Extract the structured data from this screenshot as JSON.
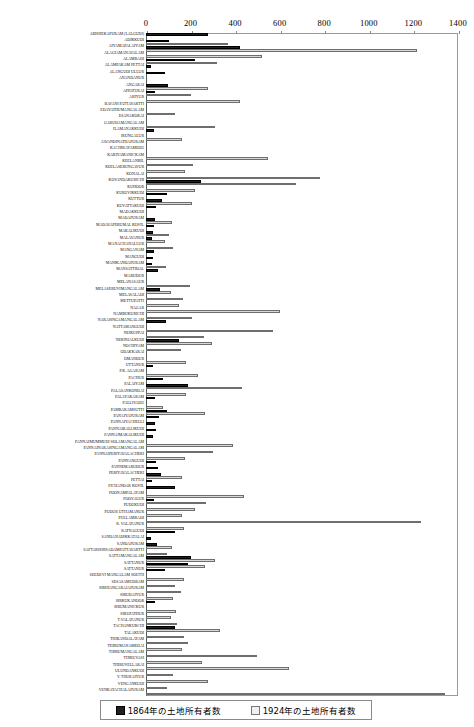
{
  "chart_data": {
    "type": "bar",
    "orientation": "horizontal",
    "title": "",
    "xlabel": "",
    "ylabel": "",
    "xlim": [
      0,
      1400
    ],
    "xticks": [
      0,
      200,
      400,
      600,
      800,
      1000,
      1200,
      1400
    ],
    "grid": false,
    "legend_position": "bottom",
    "series": [
      {
        "name": "1864年の土地所有者数",
        "color": "#202020"
      },
      {
        "name": "1924年の土地所有者数",
        "color": "#f0f0f0"
      }
    ],
    "categories": [
      "ABISHEKAPURAM (LALGUDI)",
      "ADIKKUDI",
      "AIYAMAPALAIYAM",
      "ALAGIAMANAVALAM",
      "ALAMBADI",
      "ALAMPAKAM PETTAI",
      "ALANGUDI ULLUR",
      "ANANDANUR",
      "ANGARAI",
      "APPATURAI",
      "ARIYUR",
      "BAVANI PATTAVARTTI",
      "EDAYATHUMANGALAM",
      "ESANAKORAI",
      "GARUDAMANGALAM",
      "ILAMANAKKUDI",
      "IRUNGALUR",
      "JAVANDINATHAPURAM",
      "KACHIRAYAMEDU",
      "KARIYAMANICKAM",
      "KEELANBIL",
      "KEELASERUNGAVUR",
      "KONALAI",
      "KOVANDAKURICHI",
      "KUHOOR",
      "KURUVIKKUDI",
      "KUTTUR",
      "KUVATTAKUDI",
      "MADAKKUDI",
      "MADAPURAM",
      "MADAVAPERUMAL KOVIL",
      "MAKALIKUDI",
      "MALAVANUR",
      "MANACHANALLUR",
      "MANGANAM",
      "MANGUDI",
      "MANIKANDAPURAM",
      "MANSATTIDAL",
      "MARUDUR",
      "MELANASAUR",
      "MELASERUVIMANGALAM",
      "MELAVALADI",
      "METTUPATTI",
      "NAGAR",
      "NAMBUKURICHI",
      "NARASINGAMANGALAM",
      "NATTAMANGUDI",
      "NEIKUPPAI",
      "NERINJALKUDI",
      "NOCHIYAM",
      "ODAKKARAI",
      "OMANDUR",
      "UTTANUR",
      "P.K. AGARAM",
      "PACHUR",
      "PALAIYAM",
      "PALASANKONDAI",
      "PALAYAKARAM",
      "PALLIVADU",
      "PAMBARAMSUTTI",
      "PANAIYAPURAM",
      "PANNAYACHELLI",
      "PANNAIBALLIKUDI",
      "PANNAIMAKALIKUDI",
      "PANNAIMUMMUDI SOLAMANGALAM",
      "PANNAINARASINGAMANGALAM",
      "PANNAIPERIYAVALACHERI",
      "PANNANGUDI",
      "PANNEMARUDUR",
      "PERIYAVALACHERI",
      "PETTAI",
      "PICHANDAR KOVIL",
      "POONAMPALAYAM",
      "POOVALUR",
      "PUDUKUDI",
      "PUDUR UTHAMANUR",
      "PULLAMBADI",
      "R. VALAYANUR",
      "RATNAGUDI",
      "SANDANADIKKATALAI",
      "SANDAPURAM",
      "SAPTARISHISADAMPATTAVARTTI",
      "SATTAMANGALAM",
      "SATTANUR",
      "SATTANUR",
      "SEEDEVI MANGALAM SOUTH",
      "SESASAMUDRAM",
      "SIRIHANGARAJAPURAM",
      "SIRUDAIYUR",
      "SIRKUKANOOR",
      "SIRUMANICKUR",
      "SIRUPATHUR",
      "T.VALAYANUR",
      "TACHANKURCHI",
      "TALAKUDI",
      "THIRANDALAYAM",
      "THIRUMANAMEDAI",
      "THIRUMANGALAM",
      "THIRUVELLARAI",
      "ULUNDANKUDI",
      "V. THURAIYUR",
      "VENGANKUDI",
      "VENKATACHALAPURAM"
    ],
    "values_1864": [
      278,
      105,
      420,
      0,
      222,
      22,
      85,
      0,
      97,
      40,
      0,
      0,
      0,
      0,
      0,
      0,
      35,
      0,
      0,
      0,
      0,
      0,
      0,
      248,
      0,
      0,
      72,
      0,
      0,
      0,
      0,
      0,
      0,
      0,
      0,
      0,
      0,
      0,
      0,
      0,
      62,
      0,
      0,
      0,
      0,
      88,
      0,
      0,
      148,
      0,
      0,
      0,
      30,
      0,
      78,
      188,
      0,
      0,
      0,
      95,
      60,
      40,
      45,
      30,
      0,
      0,
      0,
      0,
      55,
      0,
      128,
      35,
      0,
      0,
      0,
      0,
      0,
      130,
      22,
      50,
      0,
      200,
      190,
      0,
      0,
      0,
      0,
      0,
      0,
      0,
      0,
      0,
      130,
      0,
      0,
      0,
      0,
      0,
      0,
      0,
      0,
      0
    ],
    "values_1924": [
      0,
      368,
      1218,
      522,
      0,
      0,
      0,
      0,
      278,
      200,
      420,
      0,
      0,
      0,
      310,
      160,
      0,
      300,
      0,
      548,
      0,
      0,
      0,
      780,
      0,
      0,
      0,
      0,
      0,
      330,
      250,
      0,
      125,
      0,
      0,
      0,
      0,
      0,
      0,
      198,
      112,
      168,
      0,
      600,
      205,
      0,
      0,
      602,
      295,
      155,
      0,
      0,
      180,
      235,
      0,
      430,
      180,
      0,
      0,
      265,
      0,
      0,
      0,
      0,
      390,
      300,
      175,
      0,
      0,
      160,
      92,
      0,
      440,
      270,
      220,
      160,
      1232,
      0,
      0,
      0,
      118,
      0,
      0,
      310,
      0,
      265,
      0,
      0,
      0,
      0,
      0,
      0,
      0,
      0,
      0,
      0,
      0,
      0,
      0,
      0,
      0,
      0
    ]
  },
  "rows": [
    {
      "label": "ABISHEKAPURAM (LALGUDI)",
      "v1864": 278,
      "v1924": 0
    },
    {
      "label": "ADIKKUDI",
      "v1864": 105,
      "v1924": 368
    },
    {
      "label": "AIYAMAPALAIYAM",
      "v1864": 420,
      "v1924": 1218
    },
    {
      "label": "ALAGIAMANAVALAM",
      "v1864": 0,
      "v1924": 522
    },
    {
      "label": "ALAMBADI",
      "v1864": 222,
      "v1924": 318
    },
    {
      "label": "ALAMPAKAM PETTAI",
      "v1864": 22,
      "v1924": 0
    },
    {
      "label": "ALANGUDI ULLUR",
      "v1864": 85,
      "v1924": 0
    },
    {
      "label": "ANANDANUR",
      "v1864": 0,
      "v1924": 0
    },
    {
      "label": "ANGARAI",
      "v1864": 97,
      "v1924": 278
    },
    {
      "label": "APPATURAI",
      "v1864": 40,
      "v1924": 200
    },
    {
      "label": "ARIYUR",
      "v1864": 0,
      "v1924": 420
    },
    {
      "label": "BAVANI PATTAVARTTI",
      "v1864": 0,
      "v1924": 0
    },
    {
      "label": "EDAYATHUMANGALAM",
      "v1864": 0,
      "v1924": 132
    },
    {
      "label": "ESANAKORAI",
      "v1864": 0,
      "v1924": 0
    },
    {
      "label": "GARUDAMANGALAM",
      "v1864": 0,
      "v1924": 310
    },
    {
      "label": "ILAMANAKKUDI",
      "v1864": 35,
      "v1924": 0
    },
    {
      "label": "IRUNGALUR",
      "v1864": 0,
      "v1924": 160
    },
    {
      "label": "JAVANDINATHAPURAM",
      "v1864": 0,
      "v1924": 0
    },
    {
      "label": "KACHIRAYAMEDU",
      "v1864": 0,
      "v1924": 0
    },
    {
      "label": "KARIYAMANICKAM",
      "v1864": 0,
      "v1924": 548
    },
    {
      "label": "KEELANBIL",
      "v1864": 0,
      "v1924": 210
    },
    {
      "label": "KEELASERUNGAVUR",
      "v1864": 0,
      "v1924": 175
    },
    {
      "label": "KONALAI",
      "v1864": 0,
      "v1924": 780
    },
    {
      "label": "KOVANDAKURICHI",
      "v1864": 248,
      "v1924": 672
    },
    {
      "label": "KUHOOR",
      "v1864": 0,
      "v1924": 222
    },
    {
      "label": "KURUVIKKUDI",
      "v1864": 95,
      "v1924": 0
    },
    {
      "label": "KUTTUR",
      "v1864": 72,
      "v1924": 205
    },
    {
      "label": "KUVATTAKUDI",
      "v1864": 45,
      "v1924": 0
    },
    {
      "label": "MADAKKUDI",
      "v1864": 0,
      "v1924": 0
    },
    {
      "label": "MADAPURAM",
      "v1864": 40,
      "v1924": 115
    },
    {
      "label": "MADAVAPERUMAL KOVIL",
      "v1864": 35,
      "v1924": 0
    },
    {
      "label": "MAKALIKUDI",
      "v1864": 30,
      "v1924": 105
    },
    {
      "label": "MALAVANUR",
      "v1864": 28,
      "v1924": 85
    },
    {
      "label": "MANACHANALLUR",
      "v1864": 0,
      "v1924": 120
    },
    {
      "label": "MANGANAM",
      "v1864": 38,
      "v1924": 0
    },
    {
      "label": "MANGUDI",
      "v1864": 30,
      "v1924": 0
    },
    {
      "label": "MANIKANDAPURAM",
      "v1864": 25,
      "v1924": 90
    },
    {
      "label": "MANSATTIDAL",
      "v1864": 55,
      "v1924": 0
    },
    {
      "label": "MARUDUR",
      "v1864": 0,
      "v1924": 0
    },
    {
      "label": "MELANASAUR",
      "v1864": 0,
      "v1924": 198
    },
    {
      "label": "MELASERUVIMANGALAM",
      "v1864": 62,
      "v1924": 112
    },
    {
      "label": "MELAVALADI",
      "v1864": 0,
      "v1924": 168
    },
    {
      "label": "METTUPATTI",
      "v1864": 0,
      "v1924": 148
    },
    {
      "label": "NAGAR",
      "v1864": 0,
      "v1924": 600
    },
    {
      "label": "NAMBUKURICHI",
      "v1864": 0,
      "v1924": 205
    },
    {
      "label": "NARASINGAMANGALAM",
      "v1864": 88,
      "v1924": 0
    },
    {
      "label": "NATTAMANGUDI",
      "v1864": 0,
      "v1924": 570
    },
    {
      "label": "NEIKUPPAI",
      "v1864": 0,
      "v1924": 260
    },
    {
      "label": "NERINJALKUDI",
      "v1864": 148,
      "v1924": 295
    },
    {
      "label": "NOCHIYAM",
      "v1864": 0,
      "v1924": 155
    },
    {
      "label": "ODAKKARAI",
      "v1864": 0,
      "v1924": 0
    },
    {
      "label": "OMANDUR",
      "v1864": 0,
      "v1924": 178
    },
    {
      "label": "UTTANUR",
      "v1864": 30,
      "v1924": 0
    },
    {
      "label": "P.K. AGARAM",
      "v1864": 0,
      "v1924": 235
    },
    {
      "label": "PACHUR",
      "v1864": 78,
      "v1924": 0
    },
    {
      "label": "PALAIYAM",
      "v1864": 188,
      "v1924": 430
    },
    {
      "label": "PALASANKONDAI",
      "v1864": 0,
      "v1924": 180
    },
    {
      "label": "PALAYAKARAM",
      "v1864": 40,
      "v1924": 0
    },
    {
      "label": "PALLIVADU",
      "v1864": 0,
      "v1924": 78
    },
    {
      "label": "PAMBARAMSUTTI",
      "v1864": 95,
      "v1924": 265
    },
    {
      "label": "PANAIYAPURAM",
      "v1864": 60,
      "v1924": 0
    },
    {
      "label": "PANNAIYACHELLI",
      "v1864": 40,
      "v1924": 0
    },
    {
      "label": "PANNAIBALLIKUDI",
      "v1864": 45,
      "v1924": 0
    },
    {
      "label": "PANNAIMAKALIKUDI",
      "v1864": 30,
      "v1924": 0
    },
    {
      "label": "PANNAIMUMMUDI SOLAMANGALAM",
      "v1864": 0,
      "v1924": 390
    },
    {
      "label": "PANNAINARASINGAMANGALAM",
      "v1864": 0,
      "v1924": 300
    },
    {
      "label": "PANNAIPERIYAVALACHERI",
      "v1864": 0,
      "v1924": 175
    },
    {
      "label": "PANNANGUDI",
      "v1864": 45,
      "v1924": 0
    },
    {
      "label": "PANNEMARUDUR",
      "v1864": 55,
      "v1924": 0
    },
    {
      "label": "PERIYAVALACHERI",
      "v1864": 68,
      "v1924": 160
    },
    {
      "label": "PETTAI",
      "v1864": 28,
      "v1924": 0
    },
    {
      "label": "PICHANDAR KOVIL",
      "v1864": 128,
      "v1924": 0
    },
    {
      "label": "POONAMPALAYAM",
      "v1864": 0,
      "v1924": 440
    },
    {
      "label": "POOVALUR",
      "v1864": 35,
      "v1924": 270
    },
    {
      "label": "PUDUKUDI",
      "v1864": 0,
      "v1924": 220
    },
    {
      "label": "PUDUR UTHAMANUR",
      "v1864": 0,
      "v1924": 160
    },
    {
      "label": "PULLAMBADI",
      "v1864": 0,
      "v1924": 1232
    },
    {
      "label": "R. VALAYANUR",
      "v1864": 0,
      "v1924": 172
    },
    {
      "label": "RATNAGUDI",
      "v1864": 130,
      "v1924": 0
    },
    {
      "label": "SANDANADIKKATALAI",
      "v1864": 22,
      "v1924": 0
    },
    {
      "label": "SANDAPURAM",
      "v1864": 50,
      "v1924": 118
    },
    {
      "label": "SAPTARISHISADAMPATTAVARTTI",
      "v1864": 0,
      "v1924": 95
    },
    {
      "label": "SATTAMANGALAM",
      "v1864": 200,
      "v1924": 310
    },
    {
      "label": "SATTANUR",
      "v1864": 190,
      "v1924": 265
    },
    {
      "label": "SATTANUR",
      "v1864": 85,
      "v1924": 0
    },
    {
      "label": "SEEDEVI MANGALAM SOUTH",
      "v1864": 0,
      "v1924": 170
    },
    {
      "label": "SESASAMUDRAM",
      "v1864": 0,
      "v1924": 130
    },
    {
      "label": "SIRIHANGARAJAPURAM",
      "v1864": 0,
      "v1924": 155
    },
    {
      "label": "SIRUDAIYUR",
      "v1864": 0,
      "v1924": 120
    },
    {
      "label": "SIRKUKANOOR",
      "v1864": 40,
      "v1924": 0
    },
    {
      "label": "SIRUMANICKUR",
      "v1864": 0,
      "v1924": 135
    },
    {
      "label": "SIRUPATHUR",
      "v1864": 0,
      "v1924": 110
    },
    {
      "label": "T.VALAYANUR",
      "v1864": 0,
      "v1924": 140
    },
    {
      "label": "TACHANKURCHI",
      "v1864": 130,
      "v1924": 330
    },
    {
      "label": "TALAKUDI",
      "v1864": 0,
      "v1924": 170
    },
    {
      "label": "THIRANDALAYAM",
      "v1864": 0,
      "v1924": 190
    },
    {
      "label": "THIRUMANAMEDAI",
      "v1864": 0,
      "v1924": 160
    },
    {
      "label": "THIRUMANGALAM",
      "v1864": 0,
      "v1924": 500
    },
    {
      "label": "THIRUVASI",
      "v1864": 0,
      "v1924": 250
    },
    {
      "label": "THIRUVELLARAI",
      "v1864": 0,
      "v1924": 640
    },
    {
      "label": "ULUNDANKUDI",
      "v1864": 0,
      "v1924": 120
    },
    {
      "label": "V. THURAIYUR",
      "v1864": 0,
      "v1924": 280
    },
    {
      "label": "VENGANKUDI",
      "v1864": 0,
      "v1924": 95
    },
    {
      "label": "VENKATACHALAPURAM",
      "v1864": 0,
      "v1924": 1340
    }
  ],
  "legend": {
    "item_1864": "1864年の土地所有者数",
    "item_1924": "1924年の土地所有者数"
  },
  "axis": {
    "ticks": [
      "0",
      "200",
      "400",
      "600",
      "800",
      "1000",
      "1200",
      "1400"
    ]
  },
  "colors": {
    "bar_1864": "#202020",
    "bar_1924": "#e0e0e0",
    "frame": "#8a8a8a"
  }
}
